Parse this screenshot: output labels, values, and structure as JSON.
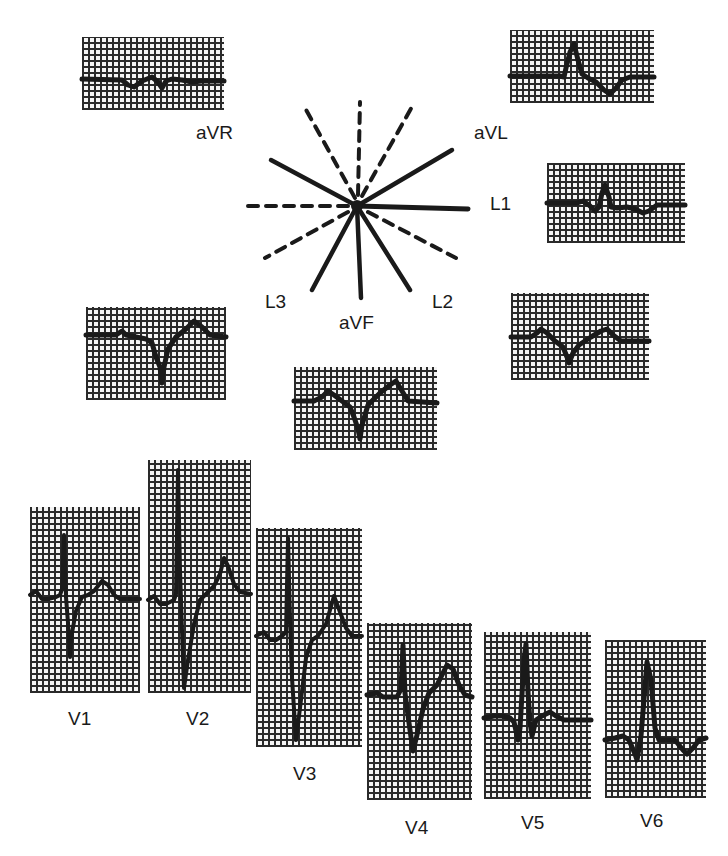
{
  "figure": {
    "limb_leads": [
      {
        "id": "aVR",
        "label": "aVR"
      },
      {
        "id": "aVL",
        "label": "aVL"
      },
      {
        "id": "L1",
        "label": "L1"
      },
      {
        "id": "L3",
        "label": "L3"
      },
      {
        "id": "aVF",
        "label": "aVF"
      },
      {
        "id": "L2",
        "label": "L2"
      }
    ],
    "precordial_leads": [
      {
        "id": "V1",
        "label": "V1"
      },
      {
        "id": "V2",
        "label": "V2"
      },
      {
        "id": "V3",
        "label": "V3"
      },
      {
        "id": "V4",
        "label": "V4"
      },
      {
        "id": "V5",
        "label": "V5"
      },
      {
        "id": "V6",
        "label": "V6"
      }
    ],
    "hexaxial_axes": {
      "solid": [
        "aVR",
        "aVL",
        "L1",
        "L3",
        "aVF",
        "L2"
      ],
      "dashed": [
        "negative extensions"
      ]
    },
    "colors": {
      "ink": "#1a1a1a",
      "grid": "#2a2a2a",
      "background": "#ffffff"
    }
  }
}
